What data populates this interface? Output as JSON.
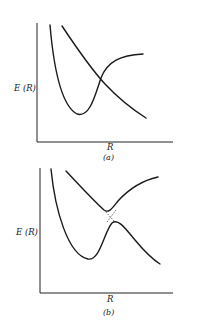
{
  "panels": [
    {
      "id": "a",
      "caption": "(a)",
      "ylabel": "E (R)",
      "xlabel": "R",
      "description": "Diabatic potential energy curves crossing: a bound (Morse-like) curve and a repulsive curve intersect."
    },
    {
      "id": "b",
      "caption": "(b)",
      "ylabel": "E (R)",
      "xlabel": "R",
      "description": "Adiabatic potential energy curves showing avoided crossing; dashed lines indicate the diabatic crossing."
    }
  ],
  "colors": {
    "ink": "#1a1a1a",
    "background": "#ffffff"
  }
}
